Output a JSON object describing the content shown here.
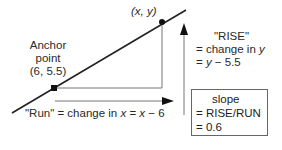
{
  "diagram": {
    "point_label": "(x, y)",
    "anchor": {
      "line1": "Anchor",
      "line2": "point",
      "line3": "(6, 5.5)"
    },
    "rise": {
      "line1": "\"RISE\"",
      "line2_prefix": "= change in ",
      "line2_var": "y",
      "line3_var": "y",
      "line3_rest": " − 5.5",
      "line3_prefix": "= "
    },
    "run": {
      "prefix": "\"Run\" = change in ",
      "var1": "x",
      "mid": " = ",
      "var2": "x",
      "rest": " − 6"
    },
    "slope_box": {
      "line1": "slope",
      "line2": "= RISE/RUN",
      "line3": "= 0.6"
    },
    "colors": {
      "line": "#222222",
      "thin_line": "#777777",
      "box_border": "#666666"
    }
  }
}
